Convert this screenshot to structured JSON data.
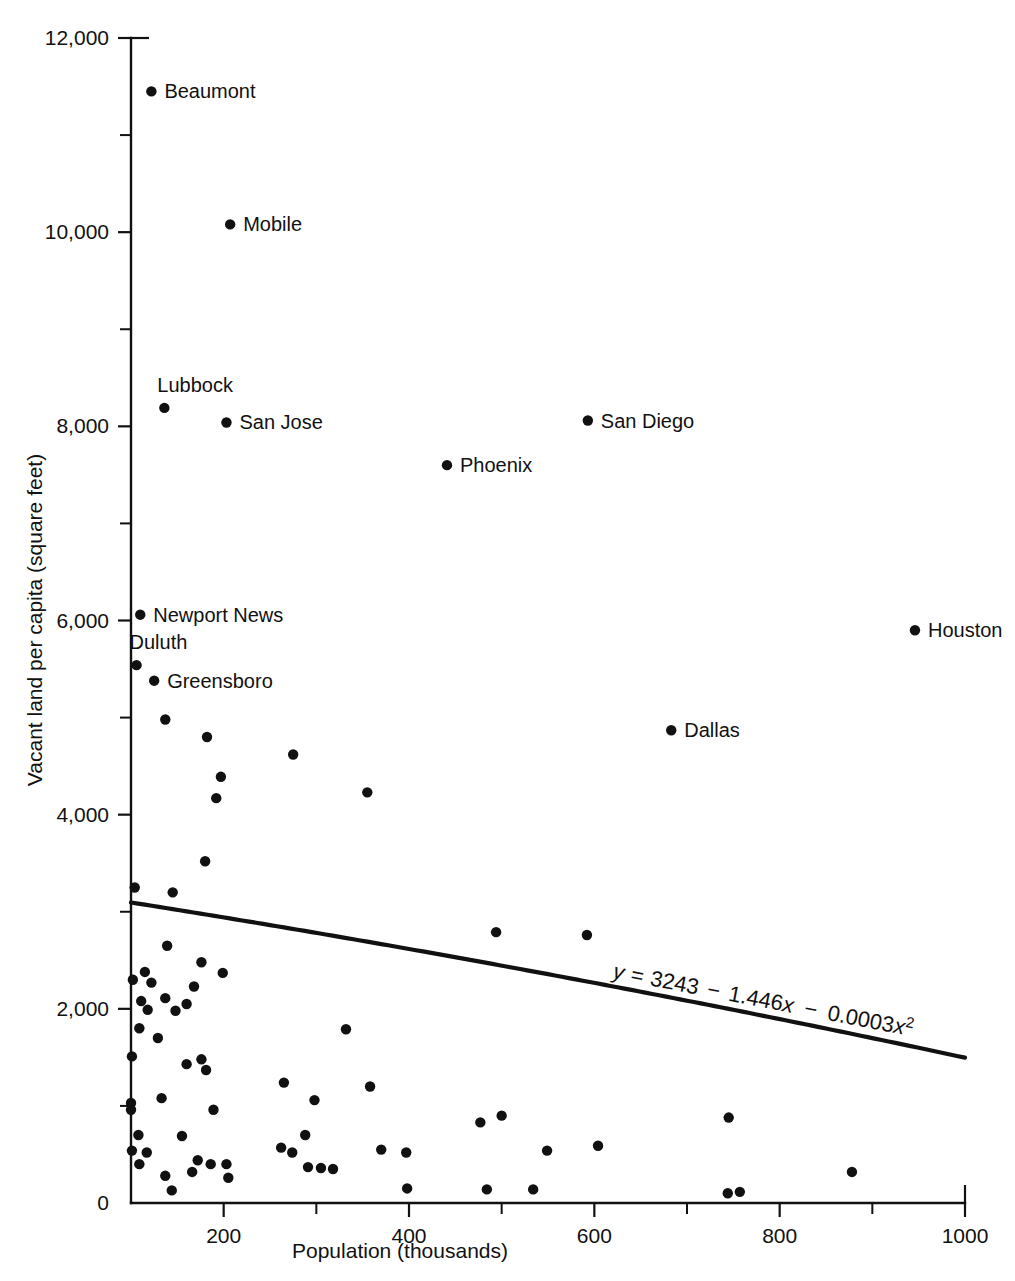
{
  "chart_data": {
    "type": "scatter",
    "title": "",
    "xlabel": "Population (thousands)",
    "ylabel": "Vacant land per capita (square feet)",
    "xlim": [
      100,
      1000
    ],
    "ylim": [
      0,
      12000
    ],
    "grid": false,
    "legend": null,
    "x_ticks_major": [
      200,
      400,
      600,
      800,
      1000
    ],
    "x_tick_labels": [
      "200",
      "400",
      "600",
      "800",
      "1000"
    ],
    "x_ticks_minor": [
      100,
      300,
      500,
      700,
      900
    ],
    "y_ticks_major": [
      0,
      2000,
      4000,
      6000,
      8000,
      10000,
      12000
    ],
    "y_tick_labels": [
      "0",
      "2,000",
      "4,000",
      "6,000",
      "8,000",
      "10,000",
      "12,000"
    ],
    "y_ticks_minor": [
      1000,
      3000,
      5000,
      7000,
      9000,
      11000
    ],
    "annotation": {
      "equation": "y = 3243 − 1.446x − 0.0003x²",
      "equation_parts": {
        "lhs": "y",
        "eq": "=",
        "intercept": "3243",
        "minus1": "−",
        "linear": "1.446x",
        "minus2": "−",
        "quadratic": "0.0003x",
        "exponent": "2"
      },
      "rotation_deg": 11
    },
    "trend": {
      "kind": "quadratic",
      "a": 3243,
      "b": -1.446,
      "c": -0.0003,
      "x_start": 100,
      "x_end": 1000
    },
    "labeled_points": [
      {
        "label": "Beaumont",
        "x": 122,
        "y": 11450,
        "label_pos": "right"
      },
      {
        "label": "Mobile",
        "x": 207,
        "y": 10080,
        "label_pos": "right"
      },
      {
        "label": "Lubbock",
        "x": 136,
        "y": 8190,
        "label_pos": "above"
      },
      {
        "label": "San Jose",
        "x": 203,
        "y": 8040,
        "label_pos": "right"
      },
      {
        "label": "San Diego",
        "x": 593,
        "y": 8060,
        "label_pos": "right"
      },
      {
        "label": "Phoenix",
        "x": 441,
        "y": 7600,
        "label_pos": "right"
      },
      {
        "label": "Newport News",
        "x": 110,
        "y": 6060,
        "label_pos": "right"
      },
      {
        "label": "Houston",
        "x": 946,
        "y": 5900,
        "label_pos": "right"
      },
      {
        "label": "Duluth",
        "x": 106,
        "y": 5540,
        "label_pos": "above"
      },
      {
        "label": "Greensboro",
        "x": 125,
        "y": 5380,
        "label_pos": "right"
      },
      {
        "label": "Dallas",
        "x": 683,
        "y": 4870,
        "label_pos": "right"
      }
    ],
    "points": [
      {
        "x": 137,
        "y": 4980
      },
      {
        "x": 182,
        "y": 4800
      },
      {
        "x": 275,
        "y": 4620
      },
      {
        "x": 197,
        "y": 4390
      },
      {
        "x": 355,
        "y": 4230
      },
      {
        "x": 192,
        "y": 4170
      },
      {
        "x": 180,
        "y": 3520
      },
      {
        "x": 104,
        "y": 3250
      },
      {
        "x": 145,
        "y": 3200
      },
      {
        "x": 494,
        "y": 2790
      },
      {
        "x": 592,
        "y": 2760
      },
      {
        "x": 139,
        "y": 2650
      },
      {
        "x": 176,
        "y": 2480
      },
      {
        "x": 115,
        "y": 2380
      },
      {
        "x": 102,
        "y": 2300
      },
      {
        "x": 199,
        "y": 2370
      },
      {
        "x": 122,
        "y": 2270
      },
      {
        "x": 168,
        "y": 2230
      },
      {
        "x": 111,
        "y": 2080
      },
      {
        "x": 160,
        "y": 2050
      },
      {
        "x": 137,
        "y": 2110
      },
      {
        "x": 118,
        "y": 1990
      },
      {
        "x": 148,
        "y": 1980
      },
      {
        "x": 332,
        "y": 1790
      },
      {
        "x": 109,
        "y": 1800
      },
      {
        "x": 129,
        "y": 1700
      },
      {
        "x": 101,
        "y": 1510
      },
      {
        "x": 176,
        "y": 1480
      },
      {
        "x": 160,
        "y": 1430
      },
      {
        "x": 181,
        "y": 1370
      },
      {
        "x": 265,
        "y": 1240
      },
      {
        "x": 358,
        "y": 1200
      },
      {
        "x": 100,
        "y": 1030
      },
      {
        "x": 100,
        "y": 960
      },
      {
        "x": 189,
        "y": 960
      },
      {
        "x": 133,
        "y": 1080
      },
      {
        "x": 298,
        "y": 1060
      },
      {
        "x": 745,
        "y": 880
      },
      {
        "x": 477,
        "y": 830
      },
      {
        "x": 500,
        "y": 900
      },
      {
        "x": 108,
        "y": 700
      },
      {
        "x": 155,
        "y": 690
      },
      {
        "x": 288,
        "y": 700
      },
      {
        "x": 262,
        "y": 570
      },
      {
        "x": 274,
        "y": 520
      },
      {
        "x": 370,
        "y": 550
      },
      {
        "x": 397,
        "y": 520
      },
      {
        "x": 549,
        "y": 540
      },
      {
        "x": 604,
        "y": 590
      },
      {
        "x": 101,
        "y": 540
      },
      {
        "x": 117,
        "y": 520
      },
      {
        "x": 109,
        "y": 400
      },
      {
        "x": 172,
        "y": 440
      },
      {
        "x": 186,
        "y": 400
      },
      {
        "x": 203,
        "y": 400
      },
      {
        "x": 291,
        "y": 370
      },
      {
        "x": 305,
        "y": 360
      },
      {
        "x": 318,
        "y": 350
      },
      {
        "x": 137,
        "y": 280
      },
      {
        "x": 166,
        "y": 320
      },
      {
        "x": 205,
        "y": 260
      },
      {
        "x": 144,
        "y": 130
      },
      {
        "x": 398,
        "y": 150
      },
      {
        "x": 484,
        "y": 140
      },
      {
        "x": 534,
        "y": 140
      },
      {
        "x": 744,
        "y": 100
      },
      {
        "x": 757,
        "y": 115
      },
      {
        "x": 878,
        "y": 320
      }
    ]
  }
}
